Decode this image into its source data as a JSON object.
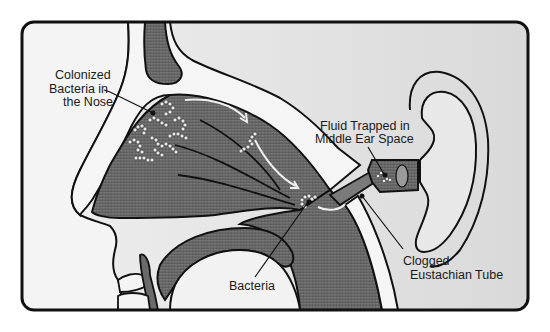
{
  "diagram": {
    "labels": {
      "colonized_line1": "Colonized",
      "colonized_line2": "Bacteria in",
      "colonized_line3": "the Nose",
      "fluid_line1": "Fluid Trapped in",
      "fluid_line2": "Middle Ear Space",
      "bacteria": "Bacteria",
      "clogged_line1": "Clogged",
      "clogged_line2": "Eustachian Tube"
    },
    "colors": {
      "frame": "#111111",
      "background": "#e6e6e6",
      "tissue_light": "#f2f2f2",
      "tissue_dark": "#6e6e6e",
      "tissue_mid": "#8a8a8a",
      "arrow": "#f0f0f0"
    }
  }
}
